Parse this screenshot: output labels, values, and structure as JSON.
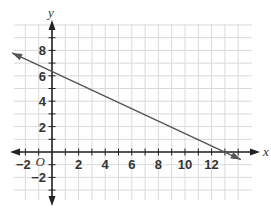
{
  "chart_data": {
    "type": "line",
    "title": "",
    "xlabel": "x",
    "ylabel": "y",
    "origin_label": "O",
    "xlim": [
      -3,
      14
    ],
    "ylim": [
      -4,
      10
    ],
    "grid": true,
    "x_ticks": [
      -2,
      2,
      4,
      6,
      8,
      10,
      12
    ],
    "x_tick_labels": [
      "−2",
      "2",
      "4",
      "6",
      "8",
      "10",
      "12"
    ],
    "y_ticks": [
      -2,
      2,
      4,
      6,
      8
    ],
    "y_tick_labels": [
      "−2",
      "2",
      "4",
      "6",
      "8"
    ],
    "series": [
      {
        "name": "line",
        "equation_estimate": "y = -0.5x + 6.3",
        "x": [
          -3,
          0,
          12.6,
          14.2
        ],
        "y": [
          7.8,
          6.3,
          0,
          -0.6
        ],
        "color": "#555555",
        "arrows": "both"
      }
    ],
    "legend": "none"
  },
  "colors": {
    "grid": "#d9d9d9",
    "axis": "#222222",
    "line": "#555555"
  }
}
